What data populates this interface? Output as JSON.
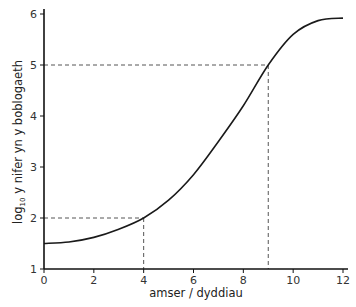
{
  "chart_data": {
    "type": "line",
    "title": "",
    "xlabel": "amser / dyddiau",
    "ylabel": "log10 y nifer yn y boblogaeth",
    "ylabel_parts": {
      "pre": "log",
      "sub": "10",
      "post": " y nifer yn y boblogaeth"
    },
    "xlim": [
      0,
      12
    ],
    "ylim": [
      1,
      6
    ],
    "xticks": [
      0,
      2,
      4,
      6,
      8,
      10,
      12
    ],
    "yticks": [
      1,
      2,
      3,
      4,
      5,
      6
    ],
    "grid": false,
    "legend": null,
    "series": [
      {
        "name": "population growth curve",
        "color": "#1a1a1a",
        "x": [
          0,
          1,
          2,
          3,
          4,
          5,
          6,
          7,
          8,
          9,
          10,
          11,
          12
        ],
        "y": [
          1.5,
          1.53,
          1.62,
          1.78,
          2.0,
          2.35,
          2.85,
          3.5,
          4.2,
          5.0,
          5.6,
          5.87,
          5.92
        ]
      }
    ],
    "annotations": [
      {
        "type": "dashed-guide",
        "x": 4,
        "y": 2,
        "color": "#555555"
      },
      {
        "type": "dashed-guide",
        "x": 9,
        "y": 5,
        "color": "#555555"
      }
    ]
  }
}
